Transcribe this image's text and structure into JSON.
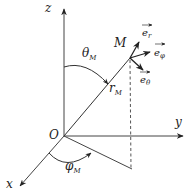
{
  "diagram": {
    "axes": {
      "x_label": "x",
      "y_label": "y",
      "z_label": "z",
      "origin_label": "O"
    },
    "point": {
      "label": "M"
    },
    "radius": {
      "main": "r",
      "sub": "M"
    },
    "polar_angle": {
      "main": "θ",
      "sub": "M"
    },
    "azimuth_angle": {
      "main": "φ",
      "sub": "M"
    },
    "unit_vectors": [
      {
        "main": "e",
        "sub": "r"
      },
      {
        "main": "e",
        "sub": "φ"
      },
      {
        "main": "e",
        "sub": "θ"
      }
    ],
    "colors": {
      "stroke": "#222222",
      "background": "#ffffff"
    }
  }
}
